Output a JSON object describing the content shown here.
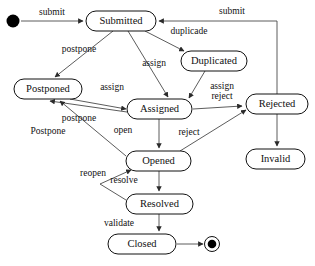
{
  "diagram": {
    "type": "uml-state-diagram",
    "colors": {
      "node_stroke": "#111111",
      "node_fill": "#ffffff",
      "edge": "#4a4a4a",
      "text": "#111111",
      "background": "#ffffff"
    },
    "states": [
      {
        "id": "start",
        "label": "",
        "kind": "initial",
        "cx": 13,
        "cy": 21,
        "r": 6.5
      },
      {
        "id": "submitted",
        "label": "Submitted",
        "kind": "state",
        "x": 86,
        "y": 11,
        "w": 70,
        "h": 20
      },
      {
        "id": "duplicated",
        "label": "Duplicated",
        "kind": "state",
        "x": 181,
        "y": 51,
        "w": 66,
        "h": 20
      },
      {
        "id": "postponed",
        "label": "Postponed",
        "kind": "state",
        "x": 14,
        "y": 79,
        "w": 68,
        "h": 20
      },
      {
        "id": "assigned",
        "label": "Assigned",
        "kind": "state",
        "x": 127,
        "y": 99,
        "w": 65,
        "h": 20
      },
      {
        "id": "rejected",
        "label": "Rejected",
        "kind": "state",
        "x": 246,
        "y": 94,
        "w": 62,
        "h": 20
      },
      {
        "id": "opened",
        "label": "Opened",
        "kind": "state",
        "x": 126,
        "y": 151,
        "w": 65,
        "h": 20
      },
      {
        "id": "invalid",
        "label": "Invalid",
        "kind": "state",
        "x": 246,
        "y": 149,
        "w": 59,
        "h": 20
      },
      {
        "id": "resolved",
        "label": "Resolved",
        "kind": "state",
        "x": 126,
        "y": 194,
        "w": 67,
        "h": 20
      },
      {
        "id": "closed",
        "label": "Closed",
        "kind": "state",
        "x": 108,
        "y": 234,
        "w": 68,
        "h": 20
      },
      {
        "id": "final",
        "label": "",
        "kind": "final",
        "cx": 212,
        "cy": 244,
        "r": 7.5
      }
    ],
    "transitions": [
      {
        "id": "t1",
        "from": "start",
        "to": "submitted",
        "label": "submit",
        "label_x": 52,
        "label_y": 13,
        "path": "M 21 21 L 83 21"
      },
      {
        "id": "t2",
        "from": "submitted",
        "to": "duplicated",
        "label": "duplicade",
        "label_x": 189,
        "label_y": 32,
        "path": "M 145 31 L 184 51"
      },
      {
        "id": "t3",
        "from": "submitted",
        "to": "postponed",
        "label": "postpone",
        "label_x": 79,
        "label_y": 50,
        "path": "M 113 31 L 55 77"
      },
      {
        "id": "t4",
        "from": "submitted",
        "to": "assigned",
        "label": "assign",
        "label_x": 154,
        "label_y": 64,
        "path": "M 128 31 L 168 97"
      },
      {
        "id": "t5",
        "from": "duplicated",
        "to": "assigned",
        "label": "assign",
        "label_x": 222,
        "label_y": 87,
        "path": "M 205 71 L 189 98"
      },
      {
        "id": "t6",
        "from": "postponed",
        "to": "assigned",
        "label": "assign",
        "label_x": 112,
        "label_y": 88,
        "path": "M 70 99 L 126 109"
      },
      {
        "id": "t7",
        "from": "assigned",
        "to": "postponed",
        "label": "postpone",
        "label_x": 79,
        "label_y": 119,
        "path": "M 127 112 L 50 101"
      },
      {
        "id": "t8",
        "from": "assigned",
        "to": "rejected",
        "label": "reject",
        "label_x": 222,
        "label_y": 97,
        "path": "M 193 109 L 242 106"
      },
      {
        "id": "t9",
        "from": "assigned",
        "to": "opened",
        "label": "open",
        "label_x": 123,
        "label_y": 131,
        "path": "M 159 119 L 159 148"
      },
      {
        "id": "t10",
        "from": "opened",
        "to": "postponed",
        "label": "Postpone",
        "label_x": 48,
        "label_y": 132,
        "path": "M 126 156 L 60 101"
      },
      {
        "id": "t11",
        "from": "opened",
        "to": "rejected",
        "label": "reject",
        "label_x": 189,
        "label_y": 133,
        "path": "M 180 151 L 246 110"
      },
      {
        "id": "t12",
        "from": "rejected",
        "to": "invalid",
        "label": "",
        "label_x": 0,
        "label_y": 0,
        "path": "M 277 114 L 277 146"
      },
      {
        "id": "t13",
        "from": "rejected",
        "to": "submitted",
        "label": "submit",
        "label_x": 232,
        "label_y": 12,
        "path": "M 277 94 L 277 21 L 159 21"
      },
      {
        "id": "t14",
        "from": "opened",
        "to": "resolved",
        "label": "resolve",
        "label_x": 124,
        "label_y": 181,
        "path": "M 159 171 L 159 191"
      },
      {
        "id": "t15",
        "from": "resolved",
        "to": "opened",
        "label": "reopen",
        "label_x": 93,
        "label_y": 174,
        "path": "M 126 200 L 100 184 L 131 170"
      },
      {
        "id": "t16",
        "from": "resolved",
        "to": "closed",
        "label": "validate",
        "label_x": 119,
        "label_y": 224,
        "path": "M 159 214 L 159 231"
      },
      {
        "id": "t17",
        "from": "closed",
        "to": "final",
        "label": "",
        "label_x": 0,
        "label_y": 0,
        "path": "M 177 244 L 203 244"
      }
    ]
  }
}
